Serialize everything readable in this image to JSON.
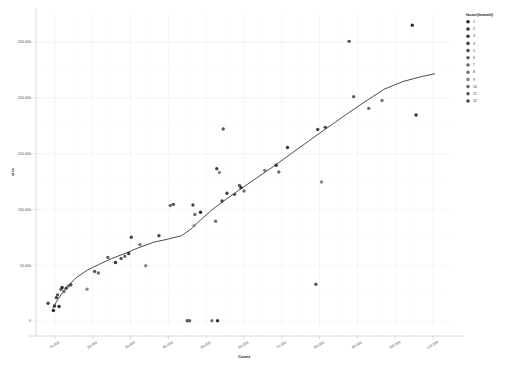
{
  "chart_data": {
    "type": "scatter",
    "title": "",
    "xlabel": "Count",
    "ylabel": "size",
    "xlim": [
      5000,
      115000
    ],
    "ylim": [
      -8000,
      275000
    ],
    "grid": true,
    "legend": {
      "position": "right",
      "title": "factor(branch)",
      "entries": [
        {
          "label": "1",
          "color": "#2a2a2a"
        },
        {
          "label": "2",
          "color": "#333333"
        },
        {
          "label": "3",
          "color": "#3d3d3d"
        },
        {
          "label": "4",
          "color": "#474747"
        },
        {
          "label": "5",
          "color": "#525252"
        },
        {
          "label": "6",
          "color": "#5e5e5e"
        },
        {
          "label": "7",
          "color": "#6b6b6b"
        },
        {
          "label": "8",
          "color": "#787878"
        },
        {
          "label": "9",
          "color": "#8a8a8a"
        },
        {
          "label": "10",
          "color": "#6e6e6e"
        },
        {
          "label": "11",
          "color": "#5a5a5a"
        },
        {
          "label": "12",
          "color": "#444444"
        }
      ]
    },
    "xticks": [
      10000,
      20000,
      30000,
      40000,
      50000,
      60000,
      70000,
      80000,
      90000,
      100000,
      110000
    ],
    "xticklabels": [
      "10,000",
      "20,000",
      "30,000",
      "40,000",
      "50,000",
      "60,000",
      "70,000",
      "80,000",
      "90,000",
      "100,000",
      "110,000"
    ],
    "yticks": [
      0,
      50000,
      100000,
      150000,
      200000,
      250000
    ],
    "yticklabels": [
      "0",
      "50,000",
      "100,000",
      "150,000",
      "200,000",
      "250,000"
    ],
    "points": [
      {
        "x": 8200,
        "y": 16000,
        "branch": "4"
      },
      {
        "x": 9600,
        "y": 9500,
        "branch": "1"
      },
      {
        "x": 9900,
        "y": 13500,
        "branch": "2"
      },
      {
        "x": 10400,
        "y": 21000,
        "branch": "3"
      },
      {
        "x": 10700,
        "y": 23500,
        "branch": "5"
      },
      {
        "x": 11100,
        "y": 13000,
        "branch": "1"
      },
      {
        "x": 11600,
        "y": 28500,
        "branch": "6"
      },
      {
        "x": 11900,
        "y": 30000,
        "branch": "2"
      },
      {
        "x": 12400,
        "y": 26500,
        "branch": "7"
      },
      {
        "x": 13000,
        "y": 29500,
        "branch": "3"
      },
      {
        "x": 13600,
        "y": 31500,
        "branch": "8"
      },
      {
        "x": 14200,
        "y": 32500,
        "branch": "4"
      },
      {
        "x": 18500,
        "y": 28500,
        "branch": "9"
      },
      {
        "x": 20500,
        "y": 44500,
        "branch": "5"
      },
      {
        "x": 21500,
        "y": 43000,
        "branch": "10"
      },
      {
        "x": 24000,
        "y": 57000,
        "branch": "6"
      },
      {
        "x": 26000,
        "y": 52500,
        "branch": "2"
      },
      {
        "x": 27500,
        "y": 56000,
        "branch": "11"
      },
      {
        "x": 28500,
        "y": 58000,
        "branch": "7"
      },
      {
        "x": 29500,
        "y": 60500,
        "branch": "3"
      },
      {
        "x": 30200,
        "y": 75000,
        "branch": "12"
      },
      {
        "x": 32500,
        "y": 68500,
        "branch": "8"
      },
      {
        "x": 34000,
        "y": 49500,
        "branch": "9"
      },
      {
        "x": 37500,
        "y": 76500,
        "branch": "4"
      },
      {
        "x": 40500,
        "y": 103500,
        "branch": "10"
      },
      {
        "x": 41300,
        "y": 104500,
        "branch": "5"
      },
      {
        "x": 45000,
        "y": 300,
        "branch": "11"
      },
      {
        "x": 45600,
        "y": 300,
        "branch": "6"
      },
      {
        "x": 46500,
        "y": 104000,
        "branch": "12"
      },
      {
        "x": 46800,
        "y": 85500,
        "branch": "9"
      },
      {
        "x": 47000,
        "y": 95500,
        "branch": "7"
      },
      {
        "x": 48500,
        "y": 97500,
        "branch": "1"
      },
      {
        "x": 51500,
        "y": 300,
        "branch": "8"
      },
      {
        "x": 53000,
        "y": 300,
        "branch": "2"
      },
      {
        "x": 52800,
        "y": 136500,
        "branch": "3"
      },
      {
        "x": 53500,
        "y": 133000,
        "branch": "9"
      },
      {
        "x": 52500,
        "y": 89500,
        "branch": "10"
      },
      {
        "x": 54500,
        "y": 172000,
        "branch": "11"
      },
      {
        "x": 54200,
        "y": 107500,
        "branch": "4"
      },
      {
        "x": 55500,
        "y": 114500,
        "branch": "12"
      },
      {
        "x": 57500,
        "y": 113500,
        "branch": "5"
      },
      {
        "x": 58800,
        "y": 121500,
        "branch": "6"
      },
      {
        "x": 59200,
        "y": 119500,
        "branch": "1"
      },
      {
        "x": 60000,
        "y": 116500,
        "branch": "7"
      },
      {
        "x": 65500,
        "y": 135000,
        "branch": "8"
      },
      {
        "x": 68500,
        "y": 139500,
        "branch": "2"
      },
      {
        "x": 69200,
        "y": 133500,
        "branch": "10"
      },
      {
        "x": 71500,
        "y": 155500,
        "branch": "3"
      },
      {
        "x": 79000,
        "y": 33000,
        "branch": "11"
      },
      {
        "x": 79500,
        "y": 171500,
        "branch": "12"
      },
      {
        "x": 80500,
        "y": 124500,
        "branch": "9"
      },
      {
        "x": 81500,
        "y": 173500,
        "branch": "4"
      },
      {
        "x": 87800,
        "y": 250500,
        "branch": "5"
      },
      {
        "x": 89000,
        "y": 201000,
        "branch": "6"
      },
      {
        "x": 93000,
        "y": 190500,
        "branch": "7"
      },
      {
        "x": 96500,
        "y": 197500,
        "branch": "8"
      },
      {
        "x": 104500,
        "y": 265000,
        "branch": "1"
      },
      {
        "x": 105500,
        "y": 184500,
        "branch": "2"
      }
    ],
    "smooth_curve": {
      "description": "fitted smooth trend line",
      "color": "#2b2b2b",
      "points": [
        {
          "x": 9400,
          "y": 11500
        },
        {
          "x": 11000,
          "y": 20500
        },
        {
          "x": 13000,
          "y": 30000
        },
        {
          "x": 15500,
          "y": 38500
        },
        {
          "x": 18500,
          "y": 45500
        },
        {
          "x": 21500,
          "y": 50500
        },
        {
          "x": 25000,
          "y": 56000
        },
        {
          "x": 28500,
          "y": 60500
        },
        {
          "x": 32000,
          "y": 65500
        },
        {
          "x": 36000,
          "y": 70500
        },
        {
          "x": 40000,
          "y": 73500
        },
        {
          "x": 43500,
          "y": 76500
        },
        {
          "x": 46000,
          "y": 82500
        },
        {
          "x": 48500,
          "y": 90500
        },
        {
          "x": 51500,
          "y": 99500
        },
        {
          "x": 55000,
          "y": 108500
        },
        {
          "x": 59000,
          "y": 118000
        },
        {
          "x": 63500,
          "y": 128500
        },
        {
          "x": 68000,
          "y": 139000
        },
        {
          "x": 72500,
          "y": 150000
        },
        {
          "x": 77000,
          "y": 161000
        },
        {
          "x": 82000,
          "y": 173000
        },
        {
          "x": 87000,
          "y": 185000
        },
        {
          "x": 92000,
          "y": 196500
        },
        {
          "x": 97000,
          "y": 207500
        },
        {
          "x": 102000,
          "y": 214500
        },
        {
          "x": 107000,
          "y": 219000
        },
        {
          "x": 110500,
          "y": 221500
        }
      ]
    }
  }
}
